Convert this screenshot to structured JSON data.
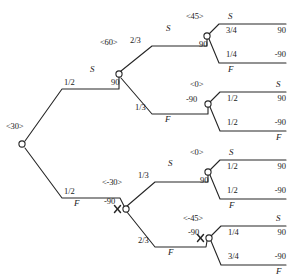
{
  "figure": {
    "type": "decision-tree",
    "root": {
      "name": "<30>",
      "x": 22,
      "y": 144
    }
  },
  "nodes": [
    {
      "id": "root",
      "name": "<30>",
      "value": "",
      "x": 22,
      "y": 144,
      "crossed": false
    },
    {
      "id": "n-up",
      "name": "<60>",
      "value": "90",
      "x": 119,
      "y": 74,
      "crossed": false
    },
    {
      "id": "n-dn",
      "name": "<-30>",
      "value": "-90",
      "x": 126,
      "y": 209,
      "crossed": true
    },
    {
      "id": "n1",
      "name": "<45>",
      "value": "90",
      "x": 207,
      "y": 36,
      "crossed": false
    },
    {
      "id": "n2",
      "name": "<0>",
      "value": "-90",
      "x": 208,
      "y": 104,
      "crossed": false
    },
    {
      "id": "n3",
      "name": "<0>",
      "value": "90",
      "x": 208,
      "y": 172,
      "crossed": false
    },
    {
      "id": "n4",
      "name": "<-45>",
      "value": "-90",
      "x": 209,
      "y": 238,
      "crossed": true
    }
  ],
  "edges": [
    {
      "id": "e-up",
      "from": "root",
      "to": "n-up",
      "prob": "1/2",
      "label": "S",
      "label_pos": "above"
    },
    {
      "id": "e-dn",
      "from": "root",
      "to": "n-dn",
      "prob": "1/2",
      "label": "F",
      "label_pos": "below"
    },
    {
      "id": "e1",
      "from": "n-up",
      "to": "n1",
      "prob": "2/3",
      "label": "S",
      "label_pos": "above"
    },
    {
      "id": "e2",
      "from": "n-up",
      "to": "n2",
      "prob": "1/3",
      "label": "F",
      "label_pos": "below"
    },
    {
      "id": "e3",
      "from": "n-dn",
      "to": "n3",
      "prob": "1/3",
      "label": "S",
      "label_pos": "above"
    },
    {
      "id": "e4",
      "from": "n-dn",
      "to": "n4",
      "prob": "2/3",
      "label": "F",
      "label_pos": "below"
    }
  ],
  "terminals": [
    {
      "id": "t1",
      "parent": "n1",
      "label": "S",
      "label_side": "left",
      "prob": "3/4",
      "payoff": "90",
      "y": 16
    },
    {
      "id": "t2",
      "parent": "n1",
      "label": "F",
      "label_side": "left",
      "prob": "1/4",
      "payoff": "-90",
      "y": 55
    },
    {
      "id": "t3",
      "parent": "n2",
      "label": "S",
      "label_side": "right",
      "prob": "1/2",
      "payoff": "90",
      "y": 84
    },
    {
      "id": "t4",
      "parent": "n2",
      "label": "F",
      "label_side": "right",
      "prob": "1/2",
      "payoff": "-90",
      "y": 123
    },
    {
      "id": "t5",
      "parent": "n3",
      "label": "S",
      "label_side": "left",
      "prob": "1/2",
      "payoff": "90",
      "y": 152
    },
    {
      "id": "t6",
      "parent": "n3",
      "label": "F",
      "label_side": "left",
      "prob": "1/2",
      "payoff": "-90",
      "y": 191
    },
    {
      "id": "t7",
      "parent": "n4",
      "label": "S",
      "label_side": "right",
      "prob": "1/4",
      "payoff": "90",
      "y": 218
    },
    {
      "id": "t8",
      "parent": "n4",
      "label": "F",
      "label_side": "right",
      "prob": "3/4",
      "payoff": "-90",
      "y": 257
    }
  ],
  "labels": {
    "root_name": "<30>",
    "up_name": "<60>",
    "dn_name": "<-30>",
    "n1_name": "<45>",
    "n2_name": "<0>",
    "n3_name": "<0>",
    "n4_name": "<-45>",
    "up_value": "90",
    "dn_value": "-90",
    "n1_value": "90",
    "n2_value": "-90",
    "n3_value": "90",
    "n4_value": "-90",
    "e_up_prob": "1/2",
    "e_up_label": "S",
    "e_dn_prob": "1/2",
    "e_dn_label": "F",
    "e1_prob": "2/3",
    "e1_label": "S",
    "e2_prob": "1/3",
    "e2_label": "F",
    "e3_prob": "1/3",
    "e3_label": "S",
    "e4_prob": "2/3",
    "e4_label": "F",
    "t1_label": "S",
    "t1_prob": "3/4",
    "t1_payoff": "90",
    "t2_label": "F",
    "t2_prob": "1/4",
    "t2_payoff": "-90",
    "t3_label": "S",
    "t3_prob": "1/2",
    "t3_payoff": "90",
    "t4_label": "F",
    "t4_prob": "1/2",
    "t4_payoff": "-90",
    "t5_label": "S",
    "t5_prob": "1/2",
    "t5_payoff": "90",
    "t6_label": "F",
    "t6_prob": "1/2",
    "t6_payoff": "-90",
    "t7_label": "S",
    "t7_prob": "1/4",
    "t7_payoff": "90",
    "t8_label": "F",
    "t8_prob": "3/4",
    "t8_payoff": "-90"
  },
  "colors": {
    "stroke": "#262626",
    "text": "#1a1a1a",
    "background": "#ffffff"
  }
}
